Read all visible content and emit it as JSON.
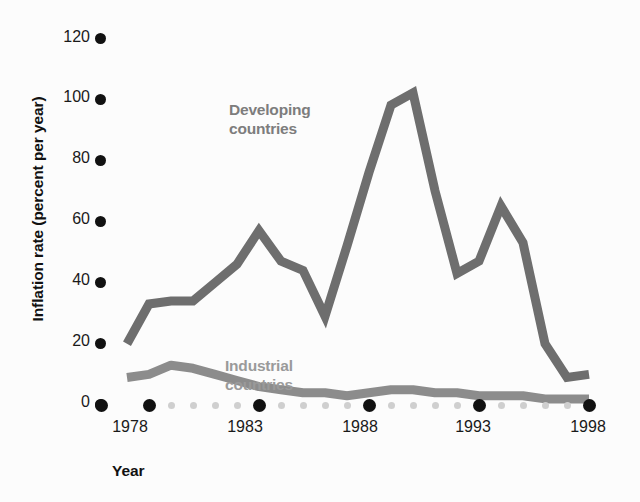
{
  "chart_data": {
    "type": "line",
    "title": "",
    "xlabel": "Year",
    "ylabel": "Inflation rate (percent per year)",
    "x": [
      1977,
      1978,
      1979,
      1980,
      1981,
      1982,
      1983,
      1984,
      1985,
      1986,
      1987,
      1988,
      1989,
      1990,
      1991,
      1992,
      1993,
      1994,
      1995,
      1996,
      1997,
      1998
    ],
    "xlim": [
      1977,
      1998
    ],
    "ylim": [
      0,
      126
    ],
    "grid": false,
    "legend_position": "inline-annotations",
    "xtick_labels": [
      "1978",
      "1983",
      "1988",
      "1993",
      "1998"
    ],
    "xtick_values": [
      1978,
      1983,
      1988,
      1993,
      1998
    ],
    "ytick_labels": [
      "0",
      "20",
      "40",
      "60",
      "80",
      "100",
      "120"
    ],
    "ytick_values": [
      0,
      20,
      40,
      60,
      80,
      100,
      120
    ],
    "series": [
      {
        "name": "Developing countries",
        "color": "#6e6e6e",
        "values": [
          20,
          33,
          34,
          34,
          40,
          46,
          57,
          47,
          44,
          29,
          52,
          76,
          98,
          102,
          70,
          43,
          47,
          65,
          53,
          20,
          9,
          10
        ]
      },
      {
        "name": "Industrial countries",
        "color": "#8c8c8c",
        "values": [
          9,
          10,
          13,
          12,
          10,
          8,
          6,
          5,
          4,
          4,
          3,
          4,
          5,
          5,
          4,
          4,
          3,
          3,
          3,
          2,
          2,
          2
        ]
      }
    ],
    "annotations": [
      {
        "text": "Developing\ncountries",
        "color": "#7d7d7d"
      },
      {
        "text": "Industrial\ncountries",
        "color": "#9a9a9a"
      }
    ]
  },
  "axes": {
    "y_label": "Inflation rate (percent per year)",
    "x_label": "Year",
    "y_ticks": [
      "120",
      "100",
      "80",
      "60",
      "40",
      "20",
      "0"
    ],
    "x_ticks": [
      "1978",
      "1983",
      "1988",
      "1993",
      "1998"
    ]
  },
  "labels": {
    "developing": "Developing\ncountries",
    "industrial": "Industrial\ncountries"
  },
  "colors": {
    "developing_line": "#6e6e6e",
    "industrial_line": "#8c8c8c",
    "tick_dot": "#111111",
    "minor_dot": "#cfcfcf",
    "text": "#1a1a1a",
    "background": "#fcfcfc"
  }
}
